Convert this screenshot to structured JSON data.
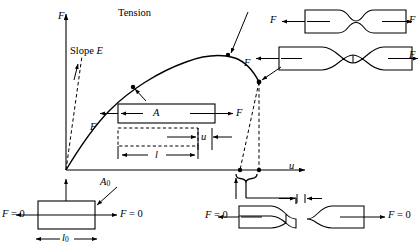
{
  "figure": {
    "title": "Tension",
    "axes": {
      "y_label": "F",
      "x_label": "u"
    },
    "annotations": {
      "slope": "Slope E",
      "area_current": "A",
      "area_original_base": "A",
      "area_original_sub": "0",
      "length_current": "l",
      "length_original_base": "l",
      "length_original_sub": "0",
      "elongation": "u",
      "force": "F",
      "zero_force": "F = 0"
    },
    "labels": {
      "force_top_left": "F",
      "force_top_right": "F",
      "force_mid_left": "F",
      "force_mid_right": "F",
      "force_box_left": "F",
      "force_box_right": "F",
      "force_curve_necking": "F",
      "force_curve_fracture": "F",
      "zero_force_left_lower": "F = 0",
      "zero_force_right_lower": "F = 0",
      "zero_force_frac_left": "F = 0",
      "zero_force_frac_right": "F = 0"
    }
  },
  "chart_data": {
    "type": "line",
    "title": "Tension",
    "xlabel": "u",
    "ylabel": "F",
    "grid": false,
    "legend": null,
    "series": [
      {
        "name": "Force-elongation curve",
        "x": [
          0,
          6,
          14,
          24,
          36,
          50,
          66,
          84,
          103,
          123,
          142,
          158,
          172,
          183,
          192,
          199,
          205,
          210
        ],
        "y": [
          0,
          18,
          34,
          50,
          65,
          78,
          89,
          98,
          105,
          110,
          113,
          114,
          113,
          110,
          105,
          98,
          90,
          82
        ]
      },
      {
        "name": "Initial elastic slope E (dashed)",
        "x": [
          0,
          18
        ],
        "y": [
          0,
          118
        ]
      },
      {
        "name": "Unloading / fracture dashed line A",
        "x": [
          210,
          174
        ],
        "y": [
          82,
          0
        ]
      },
      {
        "name": "Unloading / fracture dashed line B",
        "x": [
          210,
          210
        ],
        "y": [
          82,
          0
        ]
      }
    ],
    "markers": [
      {
        "label": "F",
        "x": 103,
        "y": 105,
        "note": "uniform deformation point"
      },
      {
        "label": "F",
        "x": 172,
        "y": 113,
        "note": "onset of necking (max force)"
      },
      {
        "label": "F",
        "x": 210,
        "y": 82,
        "note": "fracture point"
      }
    ],
    "xlim": [
      0,
      260
    ],
    "ylim": [
      0,
      140
    ]
  }
}
